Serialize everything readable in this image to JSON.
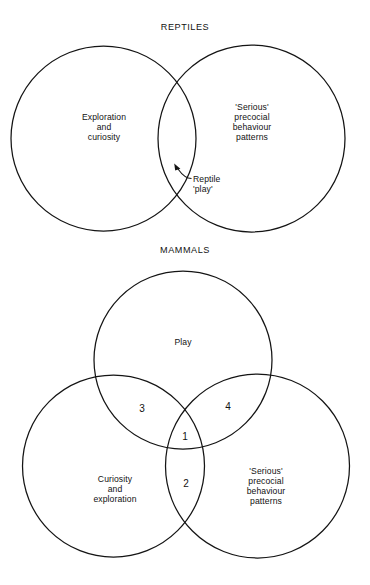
{
  "figure": {
    "background_color": "#ffffff",
    "line_color": "#141414",
    "text_color": "#121212"
  },
  "panels": [
    {
      "id": "reptiles",
      "title": "REPTILES",
      "type": "venn-2-set",
      "sets": [
        {
          "name": "exploration-and-curiosity",
          "label": "Exploration\nand\ncuriosity",
          "cx": 103.5,
          "cy": 138.5,
          "r": 92.5
        },
        {
          "name": "serious-precocial-behaviour-patterns",
          "label": "'Serious'\nprecocial\nbehaviour\npatterns",
          "cx": 251.5,
          "cy": 138.5,
          "r": 93.5
        }
      ],
      "annotations": [
        {
          "name": "reptile-play",
          "label": "Reptile\n'play'",
          "points_to": "intersection"
        }
      ]
    },
    {
      "id": "mammals",
      "title": "MAMMALS",
      "type": "venn-3-set",
      "sets": [
        {
          "name": "play",
          "label": "Play",
          "cx": 183.0,
          "cy": 360.0,
          "r": 89.0
        },
        {
          "name": "curiosity-and-exploration",
          "label": "Curiosity\nand\nexploration",
          "cx": 113.5,
          "cy": 466.0,
          "r": 91.0
        },
        {
          "name": "serious-precocial-behaviour-patterns",
          "label": "'Serious'\nprecocial\nbehaviour\npatterns",
          "cx": 257.5,
          "cy": 466.0,
          "r": 92.0
        }
      ],
      "regions": [
        {
          "name": "region-3",
          "label": "3",
          "meaning": "play-and-curiosity"
        },
        {
          "name": "region-4",
          "label": "4",
          "meaning": "play-and-serious"
        },
        {
          "name": "region-1",
          "label": "1",
          "meaning": "all-three"
        },
        {
          "name": "region-2",
          "label": "2",
          "meaning": "curiosity-and-serious"
        }
      ]
    }
  ]
}
